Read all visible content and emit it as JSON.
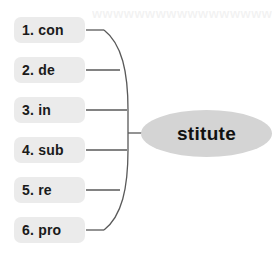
{
  "diagram": {
    "type": "word-building-brace-map",
    "background_color": "#ffffff",
    "ghost_text": "wwwwwwwwwwwwwwwwww",
    "chip_color": "#ebebeb",
    "chip_text_color": "#1a1a1a",
    "node_color": "#d4d4d4",
    "connector_color": "#595959"
  },
  "prefixes": [
    {
      "index": "1.",
      "text": "con",
      "label": "1. con"
    },
    {
      "index": "2.",
      "text": "de",
      "label": "2. de"
    },
    {
      "index": "3.",
      "text": "in",
      "label": "3. in"
    },
    {
      "index": "4.",
      "text": "sub",
      "label": "4. sub"
    },
    {
      "index": "5.",
      "text": "re",
      "label": "5. re"
    },
    {
      "index": "6.",
      "text": "pro",
      "label": "6. pro"
    }
  ],
  "root": {
    "label": "stitute"
  }
}
